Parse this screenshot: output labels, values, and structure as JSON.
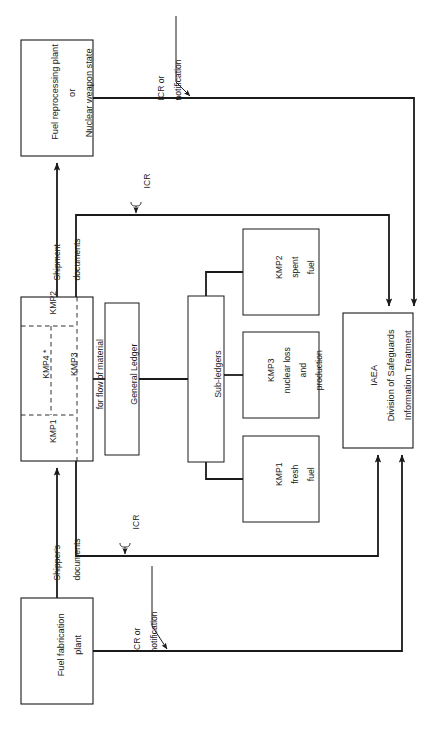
{
  "figure": {
    "orientation": "rotated-90-ccw",
    "line_color": "#1a1a1a",
    "box_fill": "#ffffff",
    "text_color": "#1a1a1a",
    "width": 432,
    "height": 730
  },
  "nodes": {
    "fuel_reprocessing": {
      "lines": [
        "Fuel reprocessing plant",
        "or",
        "Nuclear weapon state"
      ]
    },
    "fuel_fabrication": {
      "lines": [
        "Fuel fabrication",
        "plant"
      ]
    },
    "facility_kmp": {
      "segments": [
        "KMP1",
        "KMP4 *",
        "KMP2",
        "KMP3"
      ],
      "caption": "for flow of material"
    },
    "general_ledger": {
      "lines": [
        "General Ledger"
      ]
    },
    "sub_ledgers": {
      "lines": [
        "Sub-ledgers"
      ]
    },
    "kmp1_fresh_fuel": {
      "lines": [
        "KMP1",
        "fresh",
        "fuel"
      ]
    },
    "kmp3_loss_production": {
      "lines": [
        "KMP3",
        "nuclear loss",
        "and",
        "production"
      ]
    },
    "kmp2_spent_fuel": {
      "lines": [
        "KMP2",
        "spent",
        "fuel"
      ]
    },
    "iaea": {
      "lines": [
        "IAEA",
        "Division of Safeguards",
        "Information Treatment"
      ]
    }
  },
  "edge_labels": {
    "shipment": "Shipment",
    "documents_top": "documents",
    "shippers": "Shipper's",
    "documents_bottom": "documents",
    "icr_top": "ICR",
    "icr_bottom": "ICR",
    "icr_or_notification_top": [
      "ICR or",
      "notification"
    ],
    "icr_or_notification_bottom": [
      "ICR or",
      "notification"
    ]
  }
}
